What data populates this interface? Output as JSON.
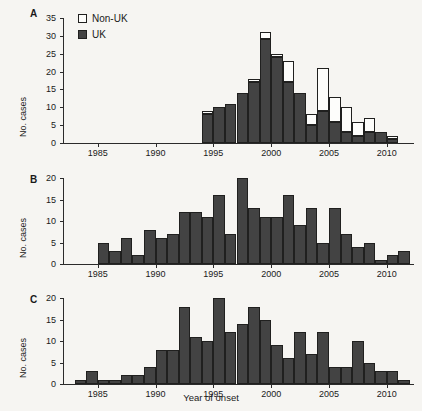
{
  "figure": {
    "background_color": "#f6f5f2",
    "bar_fill_uk": "#434343",
    "bar_fill_nonuk": "#fdfdfb",
    "bar_stroke": "#20201f",
    "xlabel": "Year of onset"
  },
  "panels": [
    {
      "letter": "A",
      "ylabel": "No. cases",
      "ylim": [
        0,
        35
      ],
      "yticks": [
        "0",
        "5",
        "10",
        "15",
        "20",
        "25",
        "30",
        "35"
      ],
      "ytick_values": [
        0,
        5,
        10,
        15,
        20,
        25,
        30,
        35
      ],
      "xlim": [
        1982,
        2012
      ],
      "xticks": [
        "1985",
        "1990",
        "1995",
        "2000",
        "2005",
        "2010"
      ],
      "xtick_values": [
        1985,
        1990,
        1995,
        2000,
        2005,
        2010
      ],
      "legend": [
        {
          "label": "Non-UK",
          "swatch": "empty"
        },
        {
          "label": "UK",
          "swatch": "filled"
        }
      ]
    },
    {
      "letter": "B",
      "ylabel": "No. cases",
      "ylim": [
        0,
        20
      ],
      "yticks": [
        "0",
        "5",
        "10",
        "15",
        "20"
      ],
      "ytick_values": [
        0,
        5,
        10,
        15,
        20
      ],
      "xlim": [
        1982,
        2012
      ],
      "xticks": [
        "1985",
        "1990",
        "1995",
        "2000",
        "2005",
        "2010"
      ],
      "xtick_values": [
        1985,
        1990,
        1995,
        2000,
        2005,
        2010
      ]
    },
    {
      "letter": "C",
      "ylabel": "No. cases",
      "ylim": [
        0,
        20
      ],
      "yticks": [
        "0",
        "5",
        "10",
        "15",
        "20"
      ],
      "ytick_values": [
        0,
        5,
        10,
        15,
        20
      ],
      "xlim": [
        1982,
        2012
      ],
      "xticks": [
        "1985",
        "1990",
        "1995",
        "2000",
        "2005",
        "2010"
      ],
      "xtick_values": [
        1985,
        1990,
        1995,
        2000,
        2005,
        2010
      ]
    }
  ],
  "chart_data": [
    {
      "type": "bar",
      "panel": "A",
      "stacked": true,
      "title": "",
      "xlabel": "Year of onset",
      "ylabel": "No. cases",
      "ylim": [
        0,
        35
      ],
      "xlim": [
        1982,
        2012
      ],
      "grid": false,
      "legend_position": "upper-left",
      "categories": [
        1994,
        1995,
        1996,
        1997,
        1998,
        1999,
        2000,
        2001,
        2002,
        2003,
        2004,
        2005,
        2006,
        2007,
        2008,
        2009,
        2010
      ],
      "series": [
        {
          "name": "UK",
          "values": [
            8,
            10,
            11,
            14,
            17,
            29,
            24,
            17,
            14,
            5,
            9,
            6,
            3,
            2,
            3,
            3,
            1
          ]
        },
        {
          "name": "Non-UK",
          "values": [
            1,
            0,
            0,
            0,
            1,
            2,
            1,
            6,
            0,
            3,
            12,
            7,
            7,
            4,
            4,
            0,
            1
          ]
        }
      ],
      "totals": [
        9,
        10,
        11,
        14,
        18,
        31,
        25,
        23,
        14,
        8,
        21,
        13,
        10,
        6,
        7,
        3,
        2
      ]
    },
    {
      "type": "bar",
      "panel": "B",
      "stacked": false,
      "title": "",
      "xlabel": "Year of onset",
      "ylabel": "No. cases",
      "ylim": [
        0,
        20
      ],
      "xlim": [
        1982,
        2012
      ],
      "grid": false,
      "categories": [
        1985,
        1986,
        1987,
        1988,
        1989,
        1990,
        1991,
        1992,
        1993,
        1994,
        1995,
        1996,
        1997,
        1998,
        1999,
        2000,
        2001,
        2002,
        2003,
        2004,
        2005,
        2006,
        2007,
        2008,
        2009,
        2010,
        2011
      ],
      "values": [
        5,
        3,
        6,
        2,
        8,
        6,
        7,
        12,
        12,
        11,
        16,
        7,
        20,
        13,
        11,
        11,
        16,
        9,
        13,
        5,
        13,
        7,
        4,
        5,
        1,
        2,
        3
      ]
    },
    {
      "type": "bar",
      "panel": "C",
      "stacked": false,
      "title": "",
      "xlabel": "Year of onset",
      "ylabel": "No. cases",
      "ylim": [
        0,
        20
      ],
      "xlim": [
        1982,
        2012
      ],
      "grid": false,
      "categories": [
        1983,
        1984,
        1985,
        1986,
        1987,
        1988,
        1989,
        1990,
        1991,
        1992,
        1993,
        1994,
        1995,
        1996,
        1997,
        1998,
        1999,
        2000,
        2001,
        2002,
        2003,
        2004,
        2005,
        2006,
        2007,
        2008,
        2009,
        2010,
        2011
      ],
      "values": [
        1,
        3,
        1,
        1,
        2,
        2,
        4,
        8,
        8,
        18,
        11,
        10,
        20,
        12,
        14,
        18,
        15,
        9,
        6,
        12,
        7,
        12,
        4,
        4,
        10,
        5,
        3,
        3,
        1
      ]
    }
  ]
}
